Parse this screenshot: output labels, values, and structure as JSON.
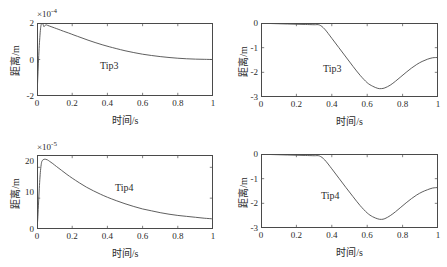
{
  "figure": {
    "panel_count": 4,
    "layout": "2x2",
    "line_color": "#4d4d4d",
    "axis_color": "#4a4a4a",
    "background": "#ffffff"
  },
  "footer": {
    "text": ""
  },
  "chart_data": [
    {
      "id": "top-left",
      "type": "line",
      "title": "",
      "annotation": "Tip3",
      "xlabel": "时间/s",
      "ylabel": "距离/m",
      "y_exponent_label": "×10",
      "y_exponent_value": "-4",
      "xlim": [
        0,
        1
      ],
      "ylim": [
        -2,
        2
      ],
      "xticks": [
        0,
        0.2,
        0.4,
        0.6,
        0.8,
        1
      ],
      "xticklabels": [
        "0",
        "0.2",
        "0.4",
        "0.6",
        "0.8",
        "1"
      ],
      "yticks": [
        -2,
        0,
        2
      ],
      "yticklabels": [
        "-2",
        "0",
        "2"
      ],
      "grid": false,
      "legend": "none",
      "series": [
        {
          "name": "Tip3",
          "x": [
            0,
            0.004,
            0.008,
            0.012,
            0.016,
            0.02,
            0.024,
            0.028,
            0.032,
            0.036,
            0.04,
            0.05,
            0.06,
            0.08,
            0.1,
            0.12,
            0.15,
            0.18,
            0.21,
            0.25,
            0.29,
            0.33,
            0.37,
            0.41,
            0.45,
            0.5,
            0.55,
            0.6,
            0.65,
            0.7,
            0.75,
            0.8,
            0.85,
            0.9,
            0.95,
            1.0
          ],
          "y": [
            -2.0,
            -1.1,
            -0.2,
            0.6,
            1.2,
            1.68,
            1.92,
            1.99,
            1.97,
            1.88,
            1.8,
            1.9,
            1.87,
            1.8,
            1.73,
            1.66,
            1.55,
            1.45,
            1.34,
            1.2,
            1.06,
            0.93,
            0.81,
            0.7,
            0.6,
            0.48,
            0.38,
            0.29,
            0.22,
            0.16,
            0.11,
            0.07,
            0.04,
            0.02,
            0.01,
            0.0
          ]
        }
      ]
    },
    {
      "id": "top-right",
      "type": "line",
      "title": "",
      "annotation": "Tip3",
      "xlabel": "时间/s",
      "ylabel": "距离/m",
      "y_exponent_label": "",
      "y_exponent_value": "",
      "xlim": [
        0,
        1
      ],
      "ylim": [
        -3,
        0
      ],
      "xticks": [
        0,
        0.2,
        0.4,
        0.6,
        0.8,
        1
      ],
      "xticklabels": [
        "0",
        "0.2",
        "0.4",
        "0.6",
        "0.8",
        "1"
      ],
      "yticks": [
        -3,
        -2,
        -1,
        0
      ],
      "yticklabels": [
        "-3",
        "-2",
        "-1",
        "0"
      ],
      "grid": false,
      "legend": "none",
      "series": [
        {
          "name": "Tip3",
          "x": [
            0,
            0.05,
            0.1,
            0.15,
            0.2,
            0.25,
            0.3,
            0.33,
            0.36,
            0.4,
            0.44,
            0.48,
            0.52,
            0.56,
            0.6,
            0.63,
            0.66,
            0.68,
            0.7,
            0.73,
            0.76,
            0.79,
            0.82,
            0.85,
            0.88,
            0.91,
            0.94,
            0.97,
            1.0
          ],
          "y": [
            -0.02,
            -0.02,
            -0.03,
            -0.04,
            -0.05,
            -0.06,
            -0.07,
            -0.08,
            -0.25,
            -0.62,
            -1.0,
            -1.38,
            -1.76,
            -2.12,
            -2.42,
            -2.56,
            -2.65,
            -2.66,
            -2.63,
            -2.52,
            -2.36,
            -2.18,
            -2.0,
            -1.83,
            -1.68,
            -1.56,
            -1.47,
            -1.41,
            -1.4
          ]
        }
      ]
    },
    {
      "id": "bottom-left",
      "type": "line",
      "title": "",
      "annotation": "Tip4",
      "xlabel": "时间/s",
      "ylabel": "距离/m",
      "y_exponent_label": "×10",
      "y_exponent_value": "-5",
      "xlim": [
        0,
        1
      ],
      "ylim": [
        0,
        24
      ],
      "xticks": [
        0,
        0.2,
        0.4,
        0.6,
        0.8,
        1
      ],
      "xticklabels": [
        "0",
        "0.2",
        "0.4",
        "0.6",
        "0.8",
        "1"
      ],
      "yticks": [
        0,
        10,
        20
      ],
      "yticklabels": [
        "0",
        "10",
        "20"
      ],
      "grid": false,
      "legend": "none",
      "series": [
        {
          "name": "Tip4",
          "x": [
            0,
            0.004,
            0.008,
            0.012,
            0.016,
            0.02,
            0.025,
            0.03,
            0.04,
            0.05,
            0.06,
            0.07,
            0.09,
            0.11,
            0.14,
            0.17,
            0.2,
            0.24,
            0.28,
            0.32,
            0.36,
            0.4,
            0.45,
            0.5,
            0.55,
            0.6,
            0.65,
            0.7,
            0.75,
            0.8,
            0.85,
            0.9,
            0.95,
            1.0
          ],
          "y": [
            0.0,
            3.0,
            7.5,
            12.0,
            16.0,
            19.0,
            21.3,
            22.2,
            22.6,
            22.6,
            22.4,
            22.0,
            21.2,
            20.3,
            19.0,
            17.7,
            16.5,
            15.0,
            13.6,
            12.4,
            11.3,
            10.3,
            9.2,
            8.2,
            7.3,
            6.5,
            5.9,
            5.3,
            4.8,
            4.4,
            4.1,
            3.8,
            3.5,
            3.3
          ]
        }
      ]
    },
    {
      "id": "bottom-right",
      "type": "line",
      "title": "",
      "annotation": "Tip4",
      "xlabel": "时间/s",
      "ylabel": "距离/m",
      "y_exponent_label": "",
      "y_exponent_value": "",
      "xlim": [
        0,
        1
      ],
      "ylim": [
        -3,
        0
      ],
      "xticks": [
        0,
        0.2,
        0.4,
        0.6,
        0.8,
        1
      ],
      "xticklabels": [
        "0",
        "0.2",
        "0.4",
        "0.6",
        "0.8",
        "1"
      ],
      "yticks": [
        -3,
        -2,
        -1,
        0
      ],
      "yticklabels": [
        "-3",
        "-2",
        "-1",
        "0"
      ],
      "grid": false,
      "legend": "none",
      "series": [
        {
          "name": "Tip4",
          "x": [
            0,
            0.05,
            0.1,
            0.15,
            0.2,
            0.25,
            0.3,
            0.33,
            0.36,
            0.4,
            0.44,
            0.48,
            0.52,
            0.56,
            0.6,
            0.63,
            0.66,
            0.68,
            0.7,
            0.73,
            0.76,
            0.79,
            0.82,
            0.85,
            0.88,
            0.91,
            0.94,
            0.97,
            1.0
          ],
          "y": [
            -0.02,
            -0.02,
            -0.03,
            -0.04,
            -0.05,
            -0.06,
            -0.07,
            -0.08,
            -0.24,
            -0.6,
            -0.98,
            -1.36,
            -1.73,
            -2.09,
            -2.39,
            -2.54,
            -2.63,
            -2.65,
            -2.62,
            -2.5,
            -2.34,
            -2.16,
            -1.98,
            -1.81,
            -1.66,
            -1.54,
            -1.45,
            -1.38,
            -1.36
          ]
        }
      ]
    }
  ]
}
